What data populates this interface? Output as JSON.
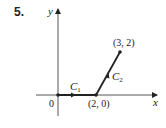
{
  "problem_number": "5.",
  "axes": {
    "x_label": "x",
    "y_label": "y",
    "origin_label": "0"
  },
  "points": [
    {
      "label": "(2, 0)",
      "x": 2,
      "y": 0
    },
    {
      "label": "(3, 2)",
      "x": 3,
      "y": 2
    }
  ],
  "curves": [
    {
      "name": "C",
      "subscript": "1",
      "from": [
        0,
        0
      ],
      "to": [
        2,
        0
      ]
    },
    {
      "name": "C",
      "subscript": "2",
      "from": [
        2,
        0
      ],
      "to": [
        3,
        2
      ]
    }
  ],
  "colors": {
    "ink": "#222222",
    "background": "#ffffff"
  }
}
